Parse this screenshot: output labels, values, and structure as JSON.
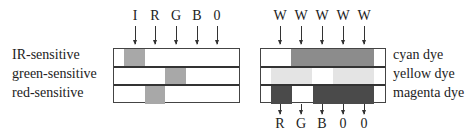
{
  "left_panel": {
    "top_labels": [
      "I",
      "R",
      "G",
      "B",
      "0"
    ],
    "row_labels": [
      "IR-sensitive",
      "green-sensitive",
      "red-sensitive"
    ],
    "rows": [
      {
        "name": "IR-sensitive",
        "segments": [
          {
            "from": 10,
            "to": 31,
            "color": "#a8a8a8"
          }
        ]
      },
      {
        "name": "green-sensitive",
        "segments": [
          {
            "from": 51,
            "to": 72,
            "color": "#a8a8a8"
          }
        ]
      },
      {
        "name": "red-sensitive",
        "segments": [
          {
            "from": 31,
            "to": 51,
            "color": "#a8a8a8"
          }
        ]
      }
    ]
  },
  "right_panel": {
    "top_labels": [
      "W",
      "W",
      "W",
      "W",
      "W"
    ],
    "bottom_labels": [
      "R",
      "G",
      "B",
      "0",
      "0"
    ],
    "row_labels": [
      "cyan dye",
      "yellow dye",
      "magenta dye"
    ],
    "rows": [
      {
        "name": "cyan dye",
        "segments": [
          {
            "from": 30,
            "to": 113,
            "color": "#8c8c8c"
          }
        ]
      },
      {
        "name": "yellow dye",
        "segments": [
          {
            "from": 10,
            "to": 51,
            "color": "#e4e4e4"
          },
          {
            "from": 72,
            "to": 113,
            "color": "#e4e4e4"
          }
        ]
      },
      {
        "name": "magenta dye",
        "segments": [
          {
            "from": 10,
            "to": 31,
            "color": "#4a4a4a"
          },
          {
            "from": 52,
            "to": 113,
            "color": "#4a4a4a"
          }
        ]
      }
    ]
  }
}
